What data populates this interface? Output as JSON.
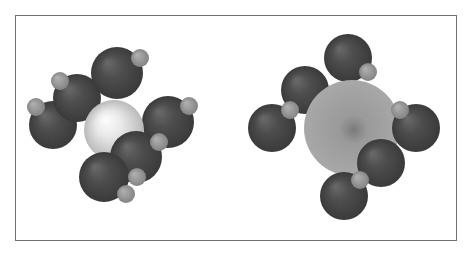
{
  "figure": {
    "canvas": {
      "width": 475,
      "height": 256
    },
    "background_color": "#ffffff",
    "frame": {
      "x": 15,
      "y": 15,
      "width": 442,
      "height": 226,
      "border_color": "#6f6f76",
      "border_width": 1,
      "fill_color": "#ffffff"
    }
  },
  "palette": {
    "central_atom_light": "#e9e9e9",
    "central_atom_light_highlight": "#fdfdfd",
    "central_atom_light_shadow": "#b9b9b9",
    "central_atom_medium": "#9a9a9a",
    "central_atom_medium_core": "#7b7b7b",
    "central_atom_medium_edge": "#a8a8a8",
    "outer_atom_dark": "#4d4d4d",
    "outer_atom_dark_highlight": "#6a6a6a",
    "outer_atom_dark_shadow": "#3a3a3a",
    "small_atom_gray": "#9c9c9c",
    "small_atom_gray_highlight": "#b2b2b2",
    "small_atom_gray_shadow": "#848484"
  },
  "molecules": [
    {
      "id": "molecule-left",
      "name": "left-molecule",
      "label": "Left space-filling model",
      "central_atom": {
        "name": "central-atom-light",
        "cx": 114,
        "cy": 130,
        "r": 30,
        "color": "#e9e9e9",
        "highlight_color": "#fdfdfd",
        "shadow_color": "#b9b9b9",
        "highlight_offset": {
          "x": -9,
          "y": -11
        },
        "z": 3
      },
      "outer_atoms": [
        {
          "name": "outer-atom-upper-left",
          "cx": 77,
          "cy": 98,
          "r": 24,
          "color": "#4d4d4d",
          "z": 2
        },
        {
          "name": "outer-atom-left",
          "cx": 53,
          "cy": 125,
          "r": 24,
          "color": "#4d4d4d",
          "z": 1
        },
        {
          "name": "outer-atom-top",
          "cx": 117,
          "cy": 73,
          "r": 26,
          "color": "#4d4d4d",
          "z": 2
        },
        {
          "name": "outer-atom-right",
          "cx": 168,
          "cy": 122,
          "r": 26,
          "color": "#4d4d4d",
          "z": 2
        },
        {
          "name": "outer-atom-lower-right",
          "cx": 136,
          "cy": 157,
          "r": 26,
          "color": "#4d4d4d",
          "z": 4
        },
        {
          "name": "outer-atom-bottom",
          "cx": 104,
          "cy": 177,
          "r": 25,
          "color": "#4d4d4d",
          "z": 4
        }
      ],
      "small_atoms": [
        {
          "name": "small-atom-upper-left",
          "cx": 60,
          "cy": 81,
          "r": 9,
          "color": "#9c9c9c",
          "z": 5
        },
        {
          "name": "small-atom-left",
          "cx": 36,
          "cy": 107,
          "r": 9,
          "color": "#9c9c9c",
          "z": 5
        },
        {
          "name": "small-atom-top",
          "cx": 140,
          "cy": 58,
          "r": 9,
          "color": "#9c9c9c",
          "z": 5
        },
        {
          "name": "small-atom-right",
          "cx": 189,
          "cy": 106,
          "r": 9,
          "color": "#9c9c9c",
          "z": 5
        },
        {
          "name": "small-atom-lower-right",
          "cx": 159,
          "cy": 142,
          "r": 9,
          "color": "#9c9c9c",
          "z": 5
        },
        {
          "name": "small-atom-bottom-right",
          "cx": 137,
          "cy": 177,
          "r": 9,
          "color": "#9c9c9c",
          "z": 5
        },
        {
          "name": "small-atom-bottom",
          "cx": 126,
          "cy": 194,
          "r": 9,
          "color": "#9c9c9c",
          "z": 5
        }
      ]
    },
    {
      "id": "molecule-right",
      "name": "right-molecule",
      "label": "Right space-filling model",
      "central_atom": {
        "name": "central-atom-medium",
        "cx": 352,
        "cy": 128,
        "r": 48,
        "color": "#9a9a9a",
        "core_color": "#7b7b7b",
        "edge_color": "#a8a8a8",
        "core_offset": {
          "x": 2,
          "y": 2
        },
        "z": 3
      },
      "outer_atoms": [
        {
          "name": "outer-atom-top",
          "cx": 348,
          "cy": 58,
          "r": 24,
          "color": "#4d4d4d",
          "z": 2
        },
        {
          "name": "outer-atom-upper-left",
          "cx": 305,
          "cy": 90,
          "r": 24,
          "color": "#4d4d4d",
          "z": 2
        },
        {
          "name": "outer-atom-left",
          "cx": 272,
          "cy": 128,
          "r": 24,
          "color": "#4d4d4d",
          "z": 2
        },
        {
          "name": "outer-atom-right",
          "cx": 416,
          "cy": 128,
          "r": 24,
          "color": "#4d4d4d",
          "z": 4
        },
        {
          "name": "outer-atom-lower-right",
          "cx": 381,
          "cy": 163,
          "r": 24,
          "color": "#4d4d4d",
          "z": 4
        },
        {
          "name": "outer-atom-bottom",
          "cx": 344,
          "cy": 196,
          "r": 24,
          "color": "#4d4d4d",
          "z": 4
        }
      ],
      "small_atoms": [
        {
          "name": "small-atom-top-right",
          "cx": 368,
          "cy": 72,
          "r": 9,
          "color": "#9c9c9c",
          "z": 5
        },
        {
          "name": "small-atom-upper-left",
          "cx": 290,
          "cy": 110,
          "r": 9,
          "color": "#9c9c9c",
          "z": 5
        },
        {
          "name": "small-atom-right",
          "cx": 400,
          "cy": 110,
          "r": 9,
          "color": "#9c9c9c",
          "z": 5
        },
        {
          "name": "small-atom-lower-right",
          "cx": 360,
          "cy": 180,
          "r": 9,
          "color": "#9c9c9c",
          "z": 5
        }
      ]
    }
  ]
}
